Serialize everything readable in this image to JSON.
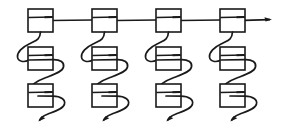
{
  "diagram": {
    "title": "Chained node structure diagram",
    "type": "linked-list-chain",
    "style": "hand-drawn line art",
    "background_color": "#ffffff",
    "ink_color": "#1a1a1a",
    "canvas": {
      "width": 282,
      "height": 133
    },
    "spine": {
      "label": "horizontal top spine",
      "y": 20,
      "x_start": 51,
      "x_end": 272,
      "terminator": "right-arrowhead"
    },
    "column_count": 4,
    "nodes_per_column": 3,
    "node_box": {
      "width": 25,
      "height": 23,
      "divider_offset_from_top": 8,
      "stub_label": "pointer-field-stub"
    },
    "columns": [
      {
        "index": 0,
        "x": 28,
        "nodes": [
          {
            "level": "head",
            "y": 9
          },
          {
            "level": "middle",
            "y": 47
          },
          {
            "level": "tail",
            "y": 84
          }
        ],
        "terminator": {
          "x": 39,
          "y": 121,
          "direction": "down-left"
        }
      },
      {
        "index": 1,
        "x": 92,
        "nodes": [
          {
            "level": "head",
            "y": 9
          },
          {
            "level": "middle",
            "y": 47
          },
          {
            "level": "tail",
            "y": 84
          }
        ],
        "terminator": {
          "x": 103,
          "y": 121,
          "direction": "down-left"
        }
      },
      {
        "index": 2,
        "x": 156,
        "nodes": [
          {
            "level": "head",
            "y": 9
          },
          {
            "level": "middle",
            "y": 47
          },
          {
            "level": "tail",
            "y": 84
          }
        ],
        "terminator": {
          "x": 167,
          "y": 121,
          "direction": "down-left"
        }
      },
      {
        "index": 3,
        "x": 220,
        "nodes": [
          {
            "level": "head",
            "y": 9
          },
          {
            "level": "middle",
            "y": 47
          },
          {
            "level": "tail",
            "y": 84
          }
        ],
        "terminator": {
          "x": 231,
          "y": 121,
          "direction": "down-left"
        }
      }
    ],
    "connector": {
      "shape": "s-curve",
      "description": "curve leaves the bottom of a node, sweeps left and down, enters the left edge of the node below, wraps around its right edge"
    }
  }
}
